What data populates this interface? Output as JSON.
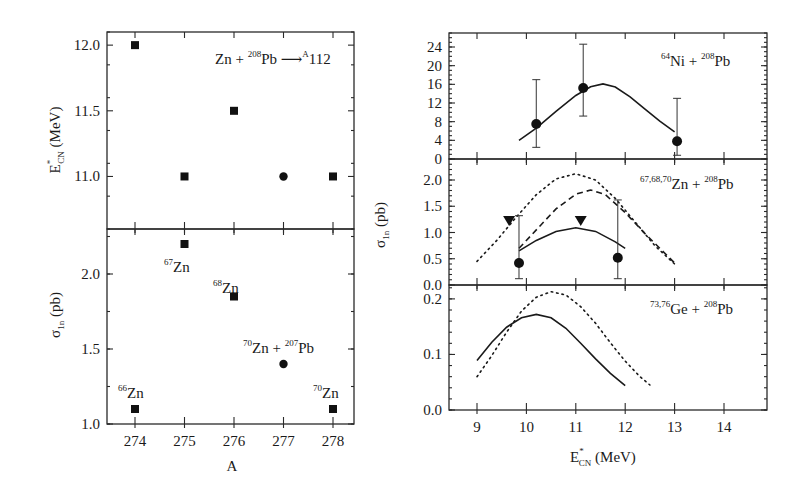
{
  "chart_data": [
    {
      "id": "left_top",
      "type": "scatter",
      "title": "",
      "annotation": "Zn + 208Pb → A112",
      "xlabel": "A",
      "ylabel": "E*CN (MeV)",
      "xlim": [
        273.5,
        278.5
      ],
      "ylim": [
        10.6,
        12.1
      ],
      "xticks": [
        274,
        275,
        276,
        277,
        278
      ],
      "yticks": [
        11.0,
        11.5,
        12.0
      ],
      "ytick_labels": [
        "11.0",
        "11.5",
        "12.0"
      ],
      "series": [
        {
          "name": "squares",
          "marker": "square",
          "points": [
            [
              274,
              12.0
            ],
            [
              275,
              11.0
            ],
            [
              276,
              11.5
            ],
            [
              278,
              11.0
            ]
          ]
        },
        {
          "name": "circle",
          "marker": "circle",
          "points": [
            [
              277,
              11.0
            ]
          ]
        }
      ]
    },
    {
      "id": "left_bottom",
      "type": "scatter",
      "xlabel": "A",
      "ylabel": "σ1n (pb)",
      "xlim": [
        273.5,
        278.5
      ],
      "ylim": [
        1.0,
        2.3
      ],
      "xticks": [
        274,
        275,
        276,
        277,
        278
      ],
      "xtick_labels": [
        "274",
        "275",
        "276",
        "277",
        "278"
      ],
      "yticks": [
        1.0,
        1.5,
        2.0
      ],
      "ytick_labels": [
        "1.0",
        "1.5",
        "2.0"
      ],
      "series": [
        {
          "name": "squares",
          "marker": "square",
          "points": [
            [
              274,
              1.1
            ],
            [
              275,
              2.2
            ],
            [
              276,
              1.85
            ],
            [
              278,
              1.1
            ]
          ]
        },
        {
          "name": "circle",
          "marker": "circle",
          "points": [
            [
              277,
              1.4
            ]
          ]
        }
      ],
      "point_labels": [
        {
          "text": "66Zn",
          "x": 274,
          "y": 1.1
        },
        {
          "text": "67Zn",
          "x": 275,
          "y": 2.2
        },
        {
          "text": "68Zn",
          "x": 276,
          "y": 1.85
        },
        {
          "text": "70Zn + 207Pb",
          "x": 277,
          "y": 1.4
        },
        {
          "text": "70Zn",
          "x": 278,
          "y": 1.1
        }
      ]
    },
    {
      "id": "right_top",
      "type": "line",
      "annotation": "64Ni + 208Pb",
      "xlim": [
        8.5,
        14.85
      ],
      "ylim": [
        0,
        27
      ],
      "yticks": [
        0,
        4,
        8,
        12,
        16,
        20,
        24
      ],
      "ytick_labels": [
        "0",
        "4",
        "8",
        "12",
        "16",
        "20",
        "24"
      ],
      "data_points": [
        {
          "x": 10.2,
          "y": 7.5,
          "err_low": 2.5,
          "err_high": 17
        },
        {
          "x": 11.15,
          "y": 15.2,
          "err_low": 9.2,
          "err_high": 24.6
        },
        {
          "x": 13.05,
          "y": 3.8,
          "err_low": 0.8,
          "err_high": 13
        }
      ],
      "series": [
        {
          "name": "calc",
          "style": "solid",
          "x": [
            9.85,
            10.2,
            10.6,
            11.0,
            11.3,
            11.55,
            11.8,
            12.1,
            12.4,
            12.7,
            13.0
          ],
          "y": [
            4.0,
            6.6,
            10.2,
            13.6,
            15.5,
            16.1,
            15.4,
            13.3,
            10.7,
            8.1,
            5.8
          ]
        }
      ]
    },
    {
      "id": "right_middle",
      "type": "line",
      "annotation": "67,68,70Zn + 208Pb",
      "ylabel": "σ1n (pb)",
      "xlim": [
        8.5,
        14.85
      ],
      "ylim": [
        0,
        2.4
      ],
      "yticks": [
        0.0,
        0.5,
        1.0,
        1.5,
        2.0
      ],
      "ytick_labels": [
        "0.0",
        "0.5",
        "1.0",
        "1.5",
        "2.0"
      ],
      "data_points": [
        {
          "x": 9.85,
          "y": 0.42,
          "err_low": 0.12,
          "err_high": 1.32,
          "marker": "circle"
        },
        {
          "x": 11.85,
          "y": 0.52,
          "err_low": 0.12,
          "err_high": 1.62,
          "marker": "circle"
        },
        {
          "x": 9.65,
          "y": 1.22,
          "marker": "triangle-down"
        },
        {
          "x": 11.1,
          "y": 1.22,
          "marker": "triangle-down"
        }
      ],
      "series": [
        {
          "name": "solid",
          "style": "solid",
          "x": [
            9.85,
            10.2,
            10.6,
            11.0,
            11.4,
            11.8,
            12.0
          ],
          "y": [
            0.65,
            0.85,
            1.02,
            1.09,
            1.02,
            0.82,
            0.7
          ]
        },
        {
          "name": "dashed",
          "style": "dashed",
          "x": [
            9.85,
            10.2,
            10.6,
            11.0,
            11.3,
            11.6,
            12.0,
            12.4,
            12.7,
            13.0
          ],
          "y": [
            0.7,
            1.05,
            1.45,
            1.73,
            1.81,
            1.72,
            1.38,
            0.98,
            0.7,
            0.42
          ]
        },
        {
          "name": "dotted",
          "style": "dotted",
          "x": [
            9.0,
            9.4,
            9.8,
            10.2,
            10.6,
            11.0,
            11.4,
            11.8,
            12.2,
            12.6,
            13.0
          ],
          "y": [
            0.45,
            0.85,
            1.3,
            1.72,
            2.02,
            2.12,
            2.0,
            1.65,
            1.2,
            0.75,
            0.4
          ]
        }
      ]
    },
    {
      "id": "right_bottom",
      "type": "line",
      "annotation": "73,76Ge + 208Pb",
      "xlabel": "E*CN (MeV)",
      "xlim": [
        8.5,
        14.85
      ],
      "ylim": [
        0,
        0.225
      ],
      "xticks": [
        9,
        10,
        11,
        12,
        13,
        14
      ],
      "xtick_labels": [
        "9",
        "10",
        "11",
        "12",
        "13",
        "14"
      ],
      "yticks": [
        0.0,
        0.1,
        0.2
      ],
      "ytick_labels": [
        "0.0",
        "0.1",
        "0.2"
      ],
      "series": [
        {
          "name": "solid",
          "style": "solid",
          "x": [
            9.0,
            9.3,
            9.6,
            9.9,
            10.2,
            10.5,
            10.8,
            11.1,
            11.4,
            11.7,
            12.0
          ],
          "y": [
            0.089,
            0.122,
            0.149,
            0.166,
            0.172,
            0.166,
            0.147,
            0.12,
            0.092,
            0.066,
            0.044
          ]
        },
        {
          "name": "dotted",
          "style": "dotted",
          "x": [
            9.0,
            9.3,
            9.6,
            9.9,
            10.2,
            10.5,
            10.8,
            11.1,
            11.4,
            11.7,
            12.0,
            12.3,
            12.5
          ],
          "y": [
            0.06,
            0.098,
            0.14,
            0.178,
            0.203,
            0.213,
            0.207,
            0.186,
            0.156,
            0.121,
            0.088,
            0.06,
            0.045
          ]
        }
      ]
    }
  ],
  "labels": {
    "left_top_ylabel_main": "E",
    "left_top_ylabel_sup": "*",
    "left_top_ylabel_sub": "CN",
    "left_top_ylabel_unit": " (MeV)",
    "left_bottom_ylabel_main": "σ",
    "left_bottom_ylabel_sub": "1n",
    "left_bottom_ylabel_unit": " (pb)",
    "left_xlabel": "A",
    "right_ylabel_main": "σ",
    "right_ylabel_sub": "1n",
    "right_ylabel_unit": " (pb)",
    "right_xlabel_main": "E",
    "right_xlabel_sup": "*",
    "right_xlabel_sub": "CN",
    "right_xlabel_unit": " (MeV)"
  }
}
